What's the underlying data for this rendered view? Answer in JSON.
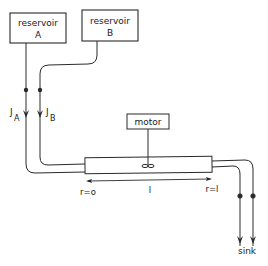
{
  "diagram": {
    "type": "flow schematic",
    "reservoirs": [
      {
        "id": "A",
        "line1": "reservoir",
        "line2": "A"
      },
      {
        "id": "B",
        "line1": "reservoir",
        "line2": "B"
      }
    ],
    "flows": {
      "a_main": "J",
      "a_sub": "A",
      "b_main": "J",
      "b_sub": "B"
    },
    "motor": {
      "label": "motor"
    },
    "dimension": {
      "start_label": "r=o",
      "length_label": "l",
      "end_label": "r=l"
    },
    "sink": {
      "label": "sink"
    },
    "colors": {
      "stroke": "#2a2a2a",
      "background": "#ffffff"
    }
  }
}
